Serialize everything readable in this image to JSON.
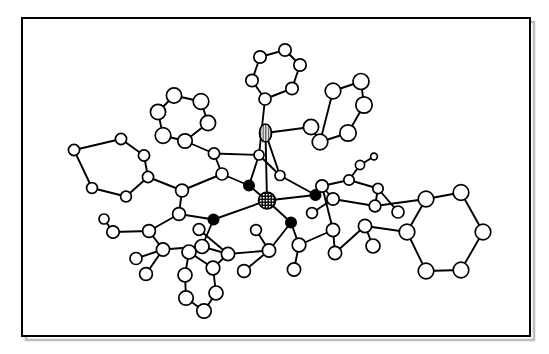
{
  "figure": {
    "kind": "molecular-structure-diagram",
    "style": "ball-and-stick crystallographic ORTEP-like drawing",
    "background_color": "#ffffff",
    "line_color": "#000000",
    "frame": {
      "x": 22,
      "y": 18,
      "width": 508,
      "height": 318,
      "stroke_color": "#000000",
      "stroke_width": 2,
      "shadow_color": "#bdbdbd"
    },
    "atom_styles": {
      "open_circle": {
        "fill": "#ffffff",
        "stroke": "#000000",
        "description": "carbon / unlabeled light atom"
      },
      "filled_circle": {
        "fill": "#000000",
        "stroke": "#000000",
        "description": "nitrogen donor atom"
      },
      "cross_hatched": {
        "fill": "#ffffff",
        "stroke": "#000000",
        "description": "central metal atom, cross hatch shading"
      },
      "vertical_striped": {
        "fill": "#ffffff",
        "stroke": "#000000",
        "description": "axial ligand atom, vertical line shading"
      }
    },
    "bond_style": {
      "stroke": "#000000",
      "stroke_width": 1.9
    },
    "counts": {
      "open_atoms": 73,
      "filled_atoms": 4,
      "hatched_atoms": 1,
      "striped_atoms": 1,
      "rings": 6
    },
    "atoms": [
      {
        "id": "M1",
        "type": "cross_hatched",
        "x": 267.0,
        "y": 200.5,
        "r": 8.5
      },
      {
        "id": "X1",
        "type": "vertical_striped",
        "x": 265.5,
        "y": 133.0,
        "rx": 6.0,
        "ry": 9.0
      },
      {
        "id": "N1",
        "type": "filled_circle",
        "x": 249.0,
        "y": 185.5,
        "r": 5.4
      },
      {
        "id": "N2",
        "type": "filled_circle",
        "x": 315.5,
        "y": 195.0,
        "r": 5.4
      },
      {
        "id": "N3",
        "type": "filled_circle",
        "x": 213.5,
        "y": 219.5,
        "r": 5.4
      },
      {
        "id": "N4",
        "type": "filled_circle",
        "x": 291.0,
        "y": 222.5,
        "r": 5.4
      },
      {
        "id": "C1",
        "type": "open_circle",
        "x": 222.0,
        "y": 174.0,
        "r": 6.0
      },
      {
        "id": "C2",
        "type": "open_circle",
        "x": 214.0,
        "y": 153.5,
        "r": 5.6
      },
      {
        "id": "C3",
        "type": "open_circle",
        "x": 259.0,
        "y": 155.0,
        "r": 5.0
      },
      {
        "id": "C4",
        "type": "open_circle",
        "x": 280.0,
        "y": 175.5,
        "r": 5.0
      },
      {
        "id": "C5",
        "type": "open_circle",
        "x": 182.0,
        "y": 190.5,
        "r": 6.4
      },
      {
        "id": "C6",
        "type": "open_circle",
        "x": 179.0,
        "y": 214.0,
        "r": 6.4
      },
      {
        "id": "C7",
        "type": "open_circle",
        "x": 149.0,
        "y": 231.0,
        "r": 6.4
      },
      {
        "id": "C8",
        "type": "open_circle",
        "x": 163.0,
        "y": 249.5,
        "r": 6.6
      },
      {
        "id": "C9",
        "type": "open_circle",
        "x": 202.0,
        "y": 246.5,
        "r": 7.0
      },
      {
        "id": "C10",
        "type": "open_circle",
        "x": 228.0,
        "y": 254.0,
        "r": 6.6
      },
      {
        "id": "C11",
        "type": "open_circle",
        "x": 269.0,
        "y": 250.5,
        "r": 6.6
      },
      {
        "id": "C12",
        "type": "open_circle",
        "x": 299.0,
        "y": 245.0,
        "r": 6.8
      },
      {
        "id": "C13",
        "type": "open_circle",
        "x": 333.0,
        "y": 230.0,
        "r": 6.6
      },
      {
        "id": "C14",
        "type": "open_circle",
        "x": 335.0,
        "y": 253.0,
        "r": 6.6
      },
      {
        "id": "C15",
        "type": "open_circle",
        "x": 365.0,
        "y": 226.0,
        "r": 6.6
      },
      {
        "id": "C16",
        "type": "open_circle",
        "x": 322.0,
        "y": 186.0,
        "r": 6.2
      },
      {
        "id": "C17",
        "type": "open_circle",
        "x": 349.0,
        "y": 180.0,
        "r": 5.2
      },
      {
        "id": "C18",
        "type": "open_circle",
        "x": 333.0,
        "y": 199.0,
        "r": 6.2
      },
      {
        "id": "C19",
        "type": "open_circle",
        "x": 360.0,
        "y": 165.0,
        "r": 4.6
      },
      {
        "id": "C20",
        "type": "open_circle",
        "x": 374.0,
        "y": 156.5,
        "r": 3.4
      },
      {
        "id": "C21",
        "type": "open_circle",
        "x": 378.0,
        "y": 188.5,
        "r": 5.2
      },
      {
        "id": "C22",
        "type": "open_circle",
        "x": 375.0,
        "y": 206.0,
        "r": 5.8
      },
      {
        "id": "C23",
        "type": "open_circle",
        "x": 294.0,
        "y": 269.5,
        "r": 6.6
      },
      {
        "id": "C24",
        "type": "open_circle",
        "x": 244.0,
        "y": 271.0,
        "r": 6.4
      },
      {
        "id": "C25",
        "type": "open_circle",
        "x": 113.0,
        "y": 232.0,
        "r": 6.2
      },
      {
        "id": "C26",
        "type": "open_circle",
        "x": 146.0,
        "y": 274.0,
        "r": 6.4
      },
      {
        "id": "R1a",
        "type": "open_circle",
        "x": 189.0,
        "y": 252.0,
        "r": 7.0
      },
      {
        "id": "R1b",
        "type": "open_circle",
        "x": 185.0,
        "y": 275.0,
        "r": 7.0
      },
      {
        "id": "R1c",
        "type": "open_circle",
        "x": 186.0,
        "y": 298.0,
        "r": 7.2
      },
      {
        "id": "R1d",
        "type": "open_circle",
        "x": 204.0,
        "y": 311.0,
        "r": 7.2
      },
      {
        "id": "R1e",
        "type": "open_circle",
        "x": 216.0,
        "y": 293.0,
        "r": 7.0
      },
      {
        "id": "R1f",
        "type": "open_circle",
        "x": 213.0,
        "y": 268.0,
        "r": 6.8
      },
      {
        "id": "R2a",
        "type": "open_circle",
        "x": 185.0,
        "y": 141.0,
        "r": 7.2
      },
      {
        "id": "R2b",
        "type": "open_circle",
        "x": 163.0,
        "y": 135.5,
        "r": 7.8
      },
      {
        "id": "R2c",
        "type": "open_circle",
        "x": 158.0,
        "y": 112.0,
        "r": 7.6
      },
      {
        "id": "R2d",
        "type": "open_circle",
        "x": 174.0,
        "y": 95.5,
        "r": 7.6
      },
      {
        "id": "R2e",
        "type": "open_circle",
        "x": 201.0,
        "y": 101.5,
        "r": 7.8
      },
      {
        "id": "R2f",
        "type": "open_circle",
        "x": 208.0,
        "y": 123.0,
        "r": 7.6
      },
      {
        "id": "R3a",
        "type": "open_circle",
        "x": 265.0,
        "y": 99.0,
        "r": 6.0
      },
      {
        "id": "R3b",
        "type": "open_circle",
        "x": 252.0,
        "y": 80.5,
        "r": 6.2
      },
      {
        "id": "R3c",
        "type": "open_circle",
        "x": 260.0,
        "y": 57.0,
        "r": 6.2
      },
      {
        "id": "R3d",
        "type": "open_circle",
        "x": 285.0,
        "y": 50.0,
        "r": 6.2
      },
      {
        "id": "R3e",
        "type": "open_circle",
        "x": 300.0,
        "y": 65.0,
        "r": 6.2
      },
      {
        "id": "R3f",
        "type": "open_circle",
        "x": 292.0,
        "y": 88.5,
        "r": 6.2
      },
      {
        "id": "R4a",
        "type": "open_circle",
        "x": 311.0,
        "y": 127.0,
        "r": 7.6
      },
      {
        "id": "R4b",
        "type": "open_circle",
        "x": 333.0,
        "y": 91.0,
        "r": 7.8
      },
      {
        "id": "R4c",
        "type": "open_circle",
        "x": 361.0,
        "y": 81.5,
        "r": 8.0
      },
      {
        "id": "R4d",
        "type": "open_circle",
        "x": 364.0,
        "y": 105.0,
        "r": 8.2
      },
      {
        "id": "R4e",
        "type": "open_circle",
        "x": 348.0,
        "y": 133.0,
        "r": 8.2
      },
      {
        "id": "R4f",
        "type": "open_circle",
        "x": 320.0,
        "y": 142.0,
        "r": 7.8
      },
      {
        "id": "R5a",
        "type": "open_circle",
        "x": 148.0,
        "y": 177.0,
        "r": 5.6
      },
      {
        "id": "R5b",
        "type": "open_circle",
        "x": 144.0,
        "y": 155.5,
        "r": 5.6
      },
      {
        "id": "R5c",
        "type": "open_circle",
        "x": 121.0,
        "y": 139.0,
        "r": 5.6
      },
      {
        "id": "R5d",
        "type": "open_circle",
        "x": 74.0,
        "y": 150.0,
        "r": 5.6
      },
      {
        "id": "R5e",
        "type": "open_circle",
        "x": 92.0,
        "y": 188.0,
        "r": 5.4
      },
      {
        "id": "R5f",
        "type": "open_circle",
        "x": 126.0,
        "y": 196.5,
        "r": 5.4
      },
      {
        "id": "R6a",
        "type": "open_circle",
        "x": 407.0,
        "y": 232.0,
        "r": 7.8
      },
      {
        "id": "R6b",
        "type": "open_circle",
        "x": 426.0,
        "y": 199.0,
        "r": 7.8
      },
      {
        "id": "R6c",
        "type": "open_circle",
        "x": 461.0,
        "y": 192.5,
        "r": 7.8
      },
      {
        "id": "R6d",
        "type": "open_circle",
        "x": 483.0,
        "y": 232.0,
        "r": 7.8
      },
      {
        "id": "R6e",
        "type": "open_circle",
        "x": 461.0,
        "y": 270.0,
        "r": 7.8
      },
      {
        "id": "R6f",
        "type": "open_circle",
        "x": 426.0,
        "y": 271.0,
        "r": 7.8
      },
      {
        "id": "H1",
        "type": "open_circle",
        "x": 104.0,
        "y": 219.0,
        "r": 5.0
      },
      {
        "id": "H2",
        "type": "open_circle",
        "x": 136.0,
        "y": 258.5,
        "r": 6.0
      },
      {
        "id": "H3",
        "type": "open_circle",
        "x": 373.0,
        "y": 246.0,
        "r": 7.0
      },
      {
        "id": "H4",
        "type": "open_circle",
        "x": 199.0,
        "y": 229.5,
        "r": 5.8
      },
      {
        "id": "H5",
        "type": "open_circle",
        "x": 256.0,
        "y": 230.0,
        "r": 5.4
      },
      {
        "id": "H6",
        "type": "open_circle",
        "x": 312.0,
        "y": 213.0,
        "r": 5.4
      },
      {
        "id": "H7",
        "type": "open_circle",
        "x": 398.0,
        "y": 212.0,
        "r": 6.0
      }
    ],
    "bonds": [
      [
        "M1",
        "N1"
      ],
      [
        "M1",
        "N2"
      ],
      [
        "M1",
        "N3"
      ],
      [
        "M1",
        "N4"
      ],
      [
        "M1",
        "X1"
      ],
      [
        "N1",
        "C1"
      ],
      [
        "N1",
        "C3"
      ],
      [
        "N2",
        "C4"
      ],
      [
        "N2",
        "C16"
      ],
      [
        "N3",
        "C6"
      ],
      [
        "N3",
        "C9"
      ],
      [
        "N4",
        "C11"
      ],
      [
        "N4",
        "C12"
      ],
      [
        "C1",
        "C2"
      ],
      [
        "C2",
        "R2a"
      ],
      [
        "C2",
        "C3"
      ],
      [
        "C3",
        "R3a"
      ],
      [
        "C3",
        "C4"
      ],
      [
        "C1",
        "C5"
      ],
      [
        "C5",
        "R5a"
      ],
      [
        "C5",
        "C6"
      ],
      [
        "C6",
        "C7"
      ],
      [
        "C7",
        "C8"
      ],
      [
        "C7",
        "C25"
      ],
      [
        "C8",
        "C9"
      ],
      [
        "C8",
        "C26"
      ],
      [
        "C9",
        "C10"
      ],
      [
        "C9",
        "R1a"
      ],
      [
        "C10",
        "R1f"
      ],
      [
        "C10",
        "C11"
      ],
      [
        "C11",
        "C24"
      ],
      [
        "C11",
        "H5"
      ],
      [
        "C12",
        "C13"
      ],
      [
        "C12",
        "C23"
      ],
      [
        "C13",
        "C14"
      ],
      [
        "C13",
        "C16"
      ],
      [
        "C14",
        "C15"
      ],
      [
        "C16",
        "C18"
      ],
      [
        "C16",
        "C17"
      ],
      [
        "C17",
        "C19"
      ],
      [
        "C19",
        "C20"
      ],
      [
        "C17",
        "C21"
      ],
      [
        "C18",
        "C22"
      ],
      [
        "C21",
        "C22"
      ],
      [
        "C22",
        "R6b"
      ],
      [
        "C15",
        "H3"
      ],
      [
        "C18",
        "H6"
      ],
      [
        "C25",
        "H1"
      ],
      [
        "C8",
        "H2"
      ],
      [
        "C10",
        "H4"
      ],
      [
        "C21",
        "H7"
      ],
      [
        "C15",
        "R6a"
      ],
      [
        "X1",
        "R4a"
      ],
      [
        "X1",
        "C4"
      ],
      [
        "R4a",
        "R4f"
      ],
      [
        "R4f",
        "R4b"
      ],
      [
        "R4b",
        "R4c"
      ],
      [
        "R4c",
        "R4d"
      ],
      [
        "R4d",
        "R4e"
      ],
      [
        "R4e",
        "R4f"
      ],
      [
        "R3a",
        "R3b"
      ],
      [
        "R3b",
        "R3c"
      ],
      [
        "R3c",
        "R3d"
      ],
      [
        "R3d",
        "R3e"
      ],
      [
        "R3e",
        "R3f"
      ],
      [
        "R3f",
        "R3a"
      ],
      [
        "R2a",
        "R2b"
      ],
      [
        "R2b",
        "R2c"
      ],
      [
        "R2c",
        "R2d"
      ],
      [
        "R2d",
        "R2e"
      ],
      [
        "R2e",
        "R2f"
      ],
      [
        "R2f",
        "R2a"
      ],
      [
        "R5a",
        "R5b"
      ],
      [
        "R5b",
        "R5c"
      ],
      [
        "R5c",
        "R5d"
      ],
      [
        "R5d",
        "R5e"
      ],
      [
        "R5e",
        "R5f"
      ],
      [
        "R5f",
        "R5a"
      ],
      [
        "R1a",
        "R1b"
      ],
      [
        "R1b",
        "R1c"
      ],
      [
        "R1c",
        "R1d"
      ],
      [
        "R1d",
        "R1e"
      ],
      [
        "R1e",
        "R1f"
      ],
      [
        "R1f",
        "R1a"
      ],
      [
        "R6a",
        "R6b"
      ],
      [
        "R6b",
        "R6c"
      ],
      [
        "R6c",
        "R6d"
      ],
      [
        "R6d",
        "R6e"
      ],
      [
        "R6e",
        "R6f"
      ],
      [
        "R6f",
        "R6a"
      ]
    ]
  }
}
